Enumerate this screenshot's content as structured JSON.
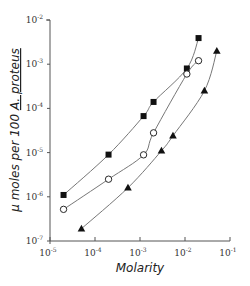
{
  "chart_data": {
    "type": "scatter",
    "title": "",
    "xlabel": "Molarity",
    "ylabel": "μ moles per 100 A. proteus",
    "xscale": "log",
    "yscale": "log",
    "xlim": [
      1e-05,
      0.1
    ],
    "ylim": [
      1e-07,
      0.01
    ],
    "x_ticks": [
      {
        "value": -5,
        "label": "10",
        "exp": "-5"
      },
      {
        "value": -4,
        "label": "10",
        "exp": "-4"
      },
      {
        "value": -3,
        "label": "10",
        "exp": "-3"
      },
      {
        "value": -2,
        "label": "10",
        "exp": "-2"
      },
      {
        "value": -1,
        "label": "10",
        "exp": "-1"
      }
    ],
    "y_ticks": [
      {
        "value": -7,
        "label": "10",
        "exp": "-7"
      },
      {
        "value": -6,
        "label": "10",
        "exp": "-6"
      },
      {
        "value": -5,
        "label": "10",
        "exp": "-5"
      },
      {
        "value": -4,
        "label": "10",
        "exp": "-4"
      },
      {
        "value": -3,
        "label": "10",
        "exp": "-3"
      },
      {
        "value": -2,
        "label": "10",
        "exp": "-2"
      }
    ],
    "grid": false,
    "legend": null,
    "series": [
      {
        "name": "filled squares",
        "marker": "square-filled",
        "x": [
          2e-05,
          0.0002,
          0.0012,
          0.002,
          0.011,
          0.02
        ],
        "y": [
          1.1e-06,
          9e-06,
          6.7e-05,
          0.00014,
          0.0008,
          0.0039
        ]
      },
      {
        "name": "open circles",
        "marker": "circle-open",
        "x": [
          2e-05,
          0.0002,
          0.0012,
          0.002,
          0.011,
          0.02
        ],
        "y": [
          5.2e-07,
          2.5e-06,
          8.9e-06,
          2.8e-05,
          0.0006,
          0.0012
        ]
      },
      {
        "name": "filled triangles",
        "marker": "triangle-filled",
        "x": [
          5e-05,
          0.00054,
          0.003,
          0.0054,
          0.027,
          0.051
        ],
        "y": [
          1.9e-07,
          1.6e-06,
          1.1e-05,
          2.4e-05,
          0.00025,
          0.002
        ]
      }
    ]
  },
  "labels": {
    "xlabel": "Molarity",
    "ylabel_prefix": "μ moles  per  100  ",
    "ylabel_species": "A. proteus"
  },
  "colors": {
    "line": "#777777",
    "marker": "#111111",
    "axis": "#555555"
  }
}
